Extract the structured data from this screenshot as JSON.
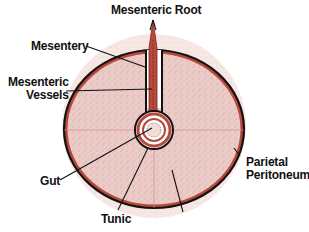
{
  "diagram": {
    "colors": {
      "background": "#ffffff",
      "cavity_fill": "#e9c7c3",
      "outer_halo": "#efd6d2",
      "outline": "#111111",
      "peritoneum_red": "#b8483a",
      "divider_lines": "#d08a80",
      "gut_inner": "#f3dcd8",
      "label_text": "#111111"
    },
    "labels": {
      "mesenteric_root": "Mesenteric Root",
      "mesentery": "Mesentery",
      "mesenteric_vessels_line1": "Mesenteric",
      "mesenteric_vessels_line2": "Vessels",
      "gut": "Gut",
      "tunic": "Tunic",
      "parietal_peritoneum_line1": "Parietal",
      "parietal_peritoneum_line2": "Peritoneum"
    }
  }
}
